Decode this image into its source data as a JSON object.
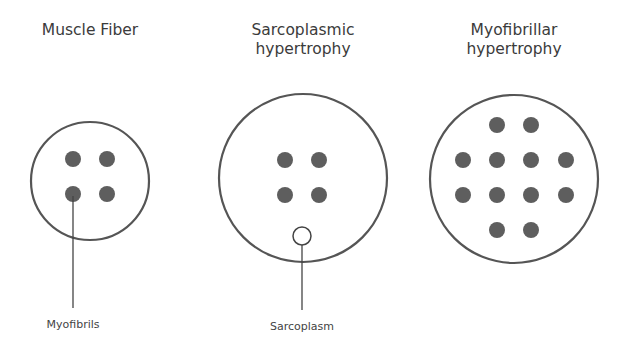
{
  "panels": [
    {
      "id": "muscle-fiber",
      "title_lines": [
        "Muscle Fiber"
      ],
      "callout_label": "Myofibrils"
    },
    {
      "id": "sarcoplasmic-hypertrophy",
      "title_lines": [
        "Sarcoplasmic",
        "hypertrophy"
      ],
      "callout_label": "Sarcoplasm"
    },
    {
      "id": "myofibrillar-hypertrophy",
      "title_lines": [
        "Myofibrillar",
        "hypertrophy"
      ]
    }
  ],
  "colors": {
    "outline": "#555555",
    "myofibril": "#5e5e5e",
    "background": "#ffffff"
  }
}
